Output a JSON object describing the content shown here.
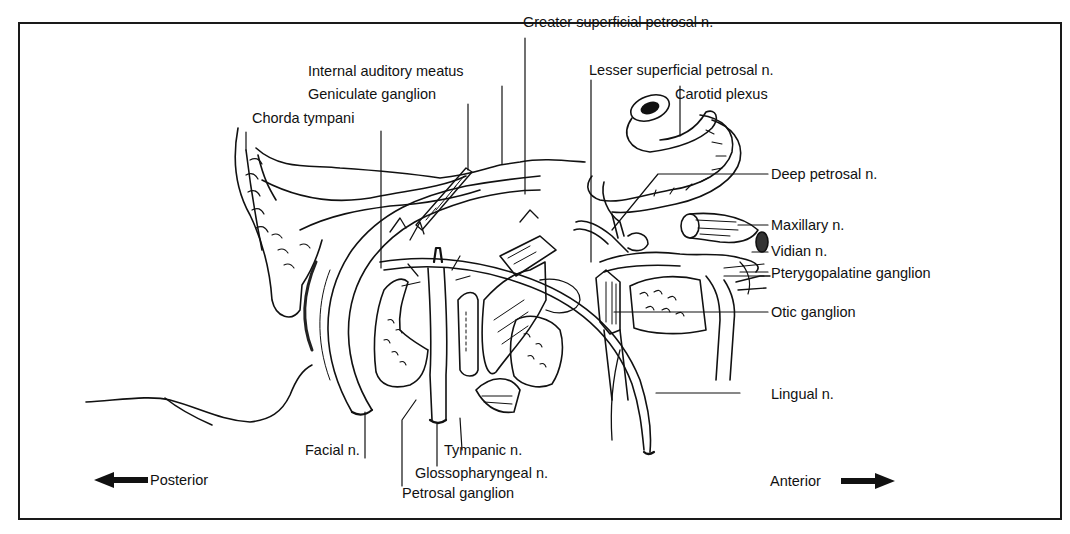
{
  "figure": {
    "type": "anatomical-diagram",
    "labels": {
      "greater_superficial_petrosal": "Greater superficial petrosal n.",
      "internal_auditory_meatus": "Internal auditory meatus",
      "lesser_superficial_petrosal": "Lesser superficial petrosal n.",
      "geniculate_ganglion": "Geniculate ganglion",
      "carotid_plexus": "Carotid plexus",
      "chorda_tympani": "Chorda tympani",
      "deep_petrosal": "Deep petrosal n.",
      "maxillary": "Maxillary n.",
      "vidian": "Vidian n.",
      "pterygopalatine_ganglion": "Pterygopalatine ganglion",
      "otic_ganglion": "Otic ganglion",
      "lingual": "Lingual n.",
      "facial": "Facial n.",
      "tympanic": "Tympanic n.",
      "glossopharyngeal": "Glossopharyngeal n.",
      "petrosal_ganglion": "Petrosal ganglion"
    },
    "orientation": {
      "posterior": "Posterior",
      "anterior": "Anterior"
    },
    "colors": {
      "ink": "#111111",
      "background": "#ffffff"
    }
  }
}
